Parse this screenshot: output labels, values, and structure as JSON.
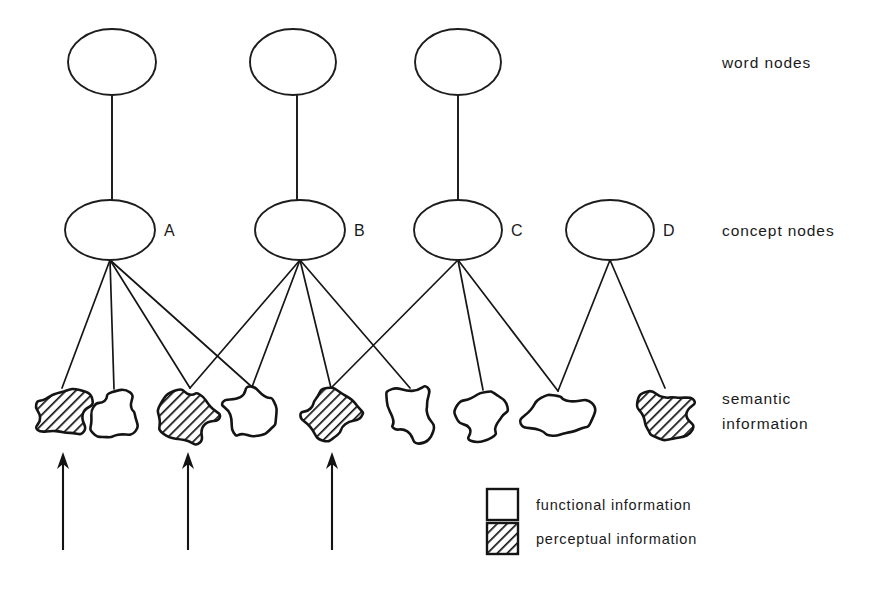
{
  "figure": {
    "background": "#ffffff",
    "ink_color": "#141414",
    "width": 892,
    "height": 604
  },
  "row_labels": [
    {
      "id": "word-nodes",
      "text": "word nodes",
      "x": 722,
      "y": 68
    },
    {
      "id": "concept-nodes",
      "text": "concept nodes",
      "x": 722,
      "y": 236
    },
    {
      "id": "semantic-information",
      "lines": [
        "semantic",
        "information"
      ],
      "x": 722,
      "y": 404
    }
  ],
  "word_nodes": [
    {
      "id": "word-node-1",
      "cx": 112,
      "cy": 62,
      "rx": 44,
      "ry": 33
    },
    {
      "id": "word-node-2",
      "cx": 293,
      "cy": 62,
      "rx": 43,
      "ry": 33
    },
    {
      "id": "word-node-3",
      "cx": 458,
      "cy": 62,
      "rx": 43,
      "ry": 33
    }
  ],
  "concept_nodes": [
    {
      "id": "concept-node-a",
      "label": "A",
      "cx": 110,
      "cy": 230,
      "rx": 45,
      "ry": 30
    },
    {
      "id": "concept-node-b",
      "label": "B",
      "cx": 300,
      "cy": 230,
      "rx": 45,
      "ry": 30
    },
    {
      "id": "concept-node-c",
      "label": "C",
      "cx": 458,
      "cy": 230,
      "rx": 44,
      "ry": 30
    },
    {
      "id": "concept-node-d",
      "label": "D",
      "cx": 610,
      "cy": 230,
      "rx": 44,
      "ry": 30
    }
  ],
  "stems": [
    {
      "id": "stem-1",
      "x": 112,
      "y1": 95,
      "y2": 200
    },
    {
      "id": "stem-2",
      "x": 297,
      "y1": 95,
      "y2": 200
    },
    {
      "id": "stem-3",
      "x": 458,
      "y1": 95,
      "y2": 200
    }
  ],
  "semantic_blobs": [
    {
      "id": "blob-1",
      "cx": 62,
      "cy": 414,
      "fill": "perceptual"
    },
    {
      "id": "blob-2",
      "cx": 114,
      "cy": 415,
      "fill": "functional"
    },
    {
      "id": "blob-3",
      "cx": 190,
      "cy": 414,
      "fill": "perceptual"
    },
    {
      "id": "blob-4",
      "cx": 252,
      "cy": 413,
      "fill": "functional"
    },
    {
      "id": "blob-5",
      "cx": 331,
      "cy": 414,
      "fill": "perceptual"
    },
    {
      "id": "blob-6",
      "cx": 410,
      "cy": 414,
      "fill": "functional"
    },
    {
      "id": "blob-7",
      "cx": 483,
      "cy": 416,
      "fill": "functional"
    },
    {
      "id": "blob-8",
      "cx": 558,
      "cy": 417,
      "fill": "functional"
    },
    {
      "id": "blob-9",
      "cx": 665,
      "cy": 414,
      "fill": "perceptual"
    }
  ],
  "links": [
    {
      "from": "concept-node-a",
      "to": "blob-1"
    },
    {
      "from": "concept-node-a",
      "to": "blob-2"
    },
    {
      "from": "concept-node-a",
      "to": "blob-3"
    },
    {
      "from": "concept-node-a",
      "to": "blob-4"
    },
    {
      "from": "concept-node-b",
      "to": "blob-3"
    },
    {
      "from": "concept-node-b",
      "to": "blob-4"
    },
    {
      "from": "concept-node-b",
      "to": "blob-5"
    },
    {
      "from": "concept-node-b",
      "to": "blob-6"
    },
    {
      "from": "concept-node-c",
      "to": "blob-5"
    },
    {
      "from": "concept-node-c",
      "to": "blob-7"
    },
    {
      "from": "concept-node-c",
      "to": "blob-8"
    },
    {
      "from": "concept-node-d",
      "to": "blob-8"
    },
    {
      "from": "concept-node-d",
      "to": "blob-9"
    }
  ],
  "input_arrows": [
    {
      "id": "input-arrow-1",
      "x": 63,
      "y_tail": 550,
      "y_head": 452
    },
    {
      "id": "input-arrow-2",
      "x": 188,
      "y_tail": 550,
      "y_head": 452
    },
    {
      "id": "input-arrow-3",
      "x": 332,
      "y_tail": 550,
      "y_head": 452
    }
  ],
  "legend": {
    "x": 487,
    "items": [
      {
        "id": "legend-functional",
        "label": "functional information",
        "swatch": "blank",
        "y": 489
      },
      {
        "id": "legend-perceptual",
        "label": "perceptual information",
        "swatch": "fill-hatch",
        "y": 523
      }
    ],
    "swatch_size": 31,
    "label_x": 536
  }
}
